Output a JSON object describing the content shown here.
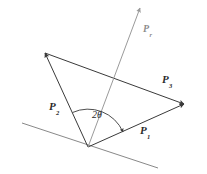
{
  "figure": {
    "type": "vector-diagram",
    "width": 207,
    "height": 174,
    "background_color": "#ffffff"
  },
  "colors": {
    "vector_stroke": "#3a3a3a",
    "resultant_stroke": "#9a9a9a",
    "baseline_stroke": "#7a7a7a",
    "arc_stroke": "#3a3a3a",
    "label_text": "#2b2b2b",
    "resultant_label_text": "#8c8c8c"
  },
  "labels": {
    "p1": {
      "base": "P",
      "subscript": "1"
    },
    "p2": {
      "base": "P",
      "subscript": "2"
    },
    "p3": {
      "base": "P",
      "subscript": "3"
    },
    "resultant": {
      "base": "P",
      "subscript": "r"
    },
    "angle": "2θ"
  },
  "geometry": {
    "vertex": {
      "x": 88,
      "y": 147
    },
    "p1_tip": {
      "x": 184,
      "y": 104
    },
    "p2_tip": {
      "x": 45,
      "y": 53
    },
    "resultant_tip": {
      "x": 140,
      "y": 8
    },
    "baseline_start": {
      "x": 22,
      "y": 123
    },
    "baseline_end": {
      "x": 158,
      "y": 168
    },
    "arc_radius": 38
  }
}
